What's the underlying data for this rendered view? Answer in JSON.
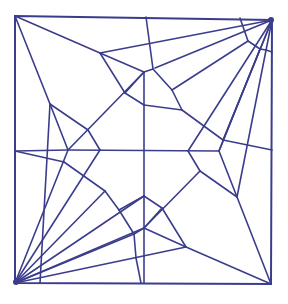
{
  "diagram": {
    "type": "origami-crease-pattern",
    "stroke_color": "#3b3d8c",
    "background": "#ffffff",
    "border": [
      [
        15,
        16
      ],
      [
        272,
        20
      ],
      [
        271,
        284
      ],
      [
        15,
        283
      ]
    ],
    "lines": [
      [
        [
          15,
          16
        ],
        [
          100,
          53
        ]
      ],
      [
        [
          100,
          53
        ],
        [
          144,
          72
        ]
      ],
      [
        [
          100,
          53
        ],
        [
          272,
          20
        ]
      ],
      [
        [
          100,
          53
        ],
        [
          125,
          93
        ]
      ],
      [
        [
          125,
          93
        ],
        [
          144,
          105
        ]
      ],
      [
        [
          144,
          105
        ],
        [
          182,
          110
        ]
      ],
      [
        [
          146,
          17
        ],
        [
          153,
          69
        ]
      ],
      [
        [
          153,
          69
        ],
        [
          144,
          72
        ]
      ],
      [
        [
          153,
          69
        ],
        [
          172,
          90
        ]
      ],
      [
        [
          172,
          90
        ],
        [
          182,
          110
        ]
      ],
      [
        [
          144,
          72
        ],
        [
          144,
          283
        ]
      ],
      [
        [
          155,
          68
        ],
        [
          272,
          20
        ]
      ],
      [
        [
          125,
          93
        ],
        [
          144,
          72
        ]
      ],
      [
        [
          15,
          16
        ],
        [
          50,
          104
        ]
      ],
      [
        [
          50,
          104
        ],
        [
          88,
          130
        ]
      ],
      [
        [
          50,
          104
        ],
        [
          68,
          150
        ]
      ],
      [
        [
          50,
          104
        ],
        [
          40,
          283
        ]
      ],
      [
        [
          88,
          130
        ],
        [
          100,
          150
        ]
      ],
      [
        [
          68,
          150
        ],
        [
          144,
          72
        ]
      ],
      [
        [
          68,
          150
        ],
        [
          15,
          283
        ]
      ],
      [
        [
          15,
          151
        ],
        [
          68,
          150
        ]
      ],
      [
        [
          68,
          150
        ],
        [
          219,
          151
        ]
      ],
      [
        [
          100,
          150
        ],
        [
          15,
          283
        ]
      ],
      [
        [
          182,
          110
        ],
        [
          223,
          140
        ]
      ],
      [
        [
          223,
          140
        ],
        [
          272,
          150
        ]
      ],
      [
        [
          223,
          140
        ],
        [
          272,
          20
        ]
      ],
      [
        [
          219,
          151
        ],
        [
          237,
          197
        ]
      ],
      [
        [
          237,
          197
        ],
        [
          272,
          20
        ]
      ],
      [
        [
          237,
          197
        ],
        [
          271,
          284
        ]
      ],
      [
        [
          188,
          151
        ],
        [
          200,
          171
        ]
      ],
      [
        [
          200,
          171
        ],
        [
          237,
          197
        ]
      ],
      [
        [
          200,
          171
        ],
        [
          144,
          228
        ]
      ],
      [
        [
          219,
          151
        ],
        [
          272,
          20
        ]
      ],
      [
        [
          188,
          151
        ],
        [
          272,
          20
        ]
      ],
      [
        [
          15,
          151
        ],
        [
          64,
          162
        ]
      ],
      [
        [
          64,
          162
        ],
        [
          105,
          191
        ]
      ],
      [
        [
          105,
          191
        ],
        [
          119,
          210
        ]
      ],
      [
        [
          119,
          210
        ],
        [
          134,
          234
        ]
      ],
      [
        [
          105,
          191
        ],
        [
          15,
          283
        ]
      ],
      [
        [
          119,
          210
        ],
        [
          144,
          196
        ]
      ],
      [
        [
          144,
          196
        ],
        [
          162,
          208
        ]
      ],
      [
        [
          162,
          208
        ],
        [
          186,
          247
        ]
      ],
      [
        [
          144,
          228
        ],
        [
          162,
          208
        ]
      ],
      [
        [
          144,
          228
        ],
        [
          134,
          234
        ]
      ],
      [
        [
          144,
          228
        ],
        [
          186,
          247
        ]
      ],
      [
        [
          186,
          247
        ],
        [
          271,
          284
        ]
      ],
      [
        [
          186,
          247
        ],
        [
          15,
          283
        ]
      ],
      [
        [
          144,
          196
        ],
        [
          15,
          283
        ]
      ],
      [
        [
          134,
          234
        ],
        [
          136,
          258
        ]
      ],
      [
        [
          136,
          258
        ],
        [
          141,
          283
        ]
      ],
      [
        [
          144,
          228
        ],
        [
          15,
          283
        ]
      ],
      [
        [
          134,
          234
        ],
        [
          15,
          283
        ]
      ],
      [
        [
          240,
          18
        ],
        [
          248,
          41
        ]
      ],
      [
        [
          248,
          41
        ],
        [
          260,
          49
        ]
      ],
      [
        [
          260,
          49
        ],
        [
          266,
          50
        ]
      ],
      [
        [
          248,
          41
        ],
        [
          172,
          90
        ]
      ],
      [
        [
          260,
          49
        ],
        [
          219,
          151
        ]
      ],
      [
        [
          266,
          50
        ],
        [
          272,
          52
        ]
      ]
    ]
  }
}
